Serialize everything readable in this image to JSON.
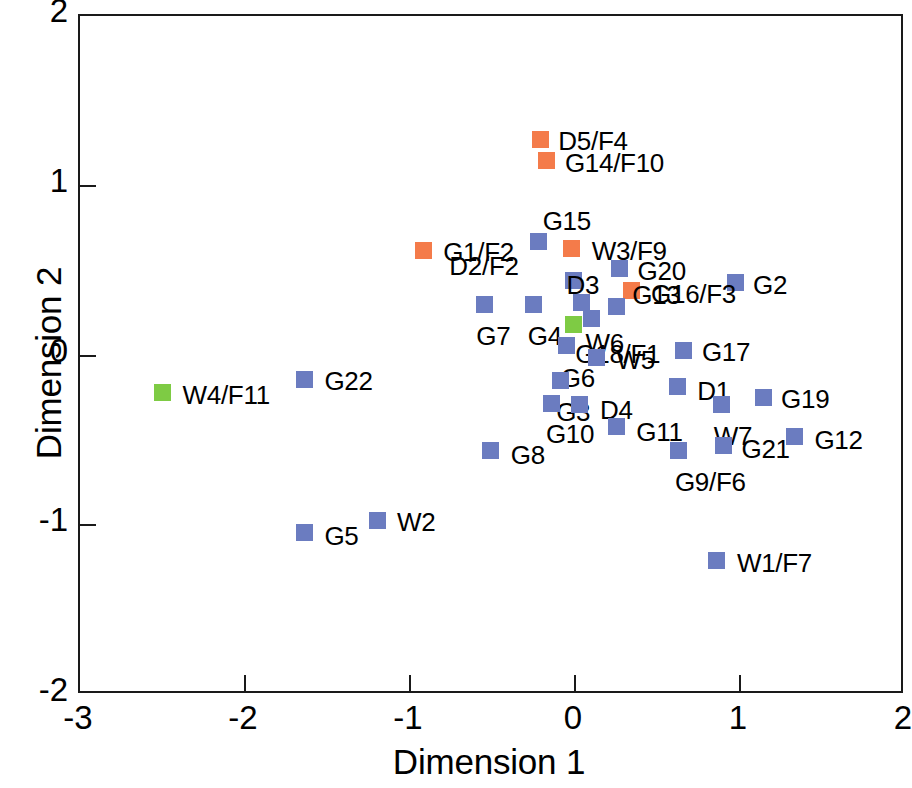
{
  "chart_data": {
    "type": "scatter",
    "title": "",
    "xlabel": "Dimension 1",
    "ylabel": "Dimension 2",
    "xlim": [
      -3,
      2
    ],
    "ylim": [
      -2,
      2
    ],
    "xticks": [
      "-3",
      "-2",
      "-1",
      "0",
      "1",
      "2"
    ],
    "xtick_values": [
      -3,
      -2,
      -1,
      0,
      1,
      2
    ],
    "yticks": [
      "2",
      "1",
      "0",
      "-1",
      "-2"
    ],
    "ytick_values": [
      2,
      1,
      0,
      -1,
      -2
    ],
    "grid": false,
    "legend": "none",
    "marker_shape": "square",
    "colors": {
      "blue": "#6b7cc0",
      "orange": "#f47b4a",
      "green": "#7ecb44"
    },
    "points": [
      {
        "label": "D5/F4",
        "x": -0.21,
        "y": 1.27,
        "color": "orange",
        "lx": 18,
        "ly": -14
      },
      {
        "label": "G14/F10",
        "x": -0.17,
        "y": 1.15,
        "color": "orange",
        "lx": 18,
        "ly": -12
      },
      {
        "label": "G15",
        "x": -0.22,
        "y": 0.67,
        "color": "blue",
        "lx": 4,
        "ly": -36
      },
      {
        "label": "G1/F2",
        "x": -0.92,
        "y": 0.62,
        "color": "orange",
        "lx": 20,
        "ly": -13
      },
      {
        "label": "W3/F9",
        "x": -0.02,
        "y": 0.63,
        "color": "orange",
        "lx": 20,
        "ly": -13
      },
      {
        "label": "G20",
        "x": 0.27,
        "y": 0.51,
        "color": "blue",
        "lx": 18,
        "ly": -13
      },
      {
        "label": "D2/F2",
        "x": -0.01,
        "y": 0.44,
        "color": "blue",
        "lx": -124,
        "ly": -30
      },
      {
        "label": "G2",
        "x": 0.97,
        "y": 0.43,
        "color": "blue",
        "lx": 18,
        "ly": -13
      },
      {
        "label": "G16/F3",
        "x": 0.34,
        "y": 0.38,
        "color": "orange",
        "lx": 20,
        "ly": -12
      },
      {
        "label": "G13",
        "x": 0.25,
        "y": 0.29,
        "color": "blue",
        "lx": 16,
        "ly": -26
      },
      {
        "label": "D3",
        "x": 0.04,
        "y": 0.31,
        "color": "blue",
        "lx": -15,
        "ly": -33
      },
      {
        "label": "G7",
        "x": -0.55,
        "y": 0.3,
        "color": "blue",
        "lx": -8,
        "ly": 16
      },
      {
        "label": "G4",
        "x": -0.25,
        "y": 0.3,
        "color": "blue",
        "lx": -6,
        "ly": 16
      },
      {
        "label": "W6",
        "x": 0.1,
        "y": 0.22,
        "color": "blue",
        "lx": -6,
        "ly": 10
      },
      {
        "label": "G18/F1",
        "x": -0.01,
        "y": 0.18,
        "color": "green",
        "lx": 2,
        "ly": 14
      },
      {
        "label": "G17",
        "x": 0.66,
        "y": 0.03,
        "color": "blue",
        "lx": 18,
        "ly": -13
      },
      {
        "label": "W5",
        "x": 0.13,
        "y": -0.01,
        "color": "blue",
        "lx": 20,
        "ly": -12
      },
      {
        "label": "G6",
        "x": -0.05,
        "y": 0.06,
        "color": "blue",
        "lx": -6,
        "ly": 18
      },
      {
        "label": "G22",
        "x": -1.64,
        "y": -0.14,
        "color": "blue",
        "lx": 20,
        "ly": -13
      },
      {
        "label": "W4/F11",
        "x": -2.5,
        "y": -0.22,
        "color": "green",
        "lx": 20,
        "ly": -13
      },
      {
        "label": "G3",
        "x": -0.09,
        "y": -0.15,
        "color": "blue",
        "lx": -4,
        "ly": 16
      },
      {
        "label": "D1",
        "x": 0.62,
        "y": -0.18,
        "color": "blue",
        "lx": 20,
        "ly": -10
      },
      {
        "label": "G19",
        "x": 1.14,
        "y": -0.25,
        "color": "blue",
        "lx": 18,
        "ly": -14
      },
      {
        "label": "G10",
        "x": -0.14,
        "y": -0.28,
        "color": "blue",
        "lx": -6,
        "ly": 16
      },
      {
        "label": "D4",
        "x": 0.03,
        "y": -0.29,
        "color": "blue",
        "lx": 20,
        "ly": -10
      },
      {
        "label": "W7",
        "x": 0.89,
        "y": -0.29,
        "color": "blue",
        "lx": -8,
        "ly": 16
      },
      {
        "label": "G11",
        "x": 0.25,
        "y": -0.42,
        "color": "blue",
        "lx": 20,
        "ly": -10
      },
      {
        "label": "G12",
        "x": 1.33,
        "y": -0.48,
        "color": "blue",
        "lx": 20,
        "ly": -12
      },
      {
        "label": "G21",
        "x": 0.9,
        "y": -0.53,
        "color": "blue",
        "lx": 18,
        "ly": -11
      },
      {
        "label": "G9/F6",
        "x": 0.63,
        "y": -0.56,
        "color": "blue",
        "lx": -4,
        "ly": 16
      },
      {
        "label": "G8",
        "x": -0.51,
        "y": -0.56,
        "color": "blue",
        "lx": 20,
        "ly": -11
      },
      {
        "label": "W2",
        "x": -1.2,
        "y": -0.97,
        "color": "blue",
        "lx": 20,
        "ly": -13
      },
      {
        "label": "G5",
        "x": -1.64,
        "y": -1.04,
        "color": "blue",
        "lx": 20,
        "ly": -11
      },
      {
        "label": "W1/F7",
        "x": 0.86,
        "y": -1.21,
        "color": "blue",
        "lx": 20,
        "ly": -13
      }
    ]
  }
}
